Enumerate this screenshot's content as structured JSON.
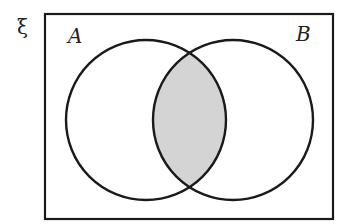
{
  "diagram": {
    "type": "venn",
    "universal_label": "ξ",
    "sets": [
      {
        "name": "A",
        "label": "A"
      },
      {
        "name": "B",
        "label": "B"
      }
    ],
    "shaded_region": "A ∩ B",
    "colors": {
      "stroke": "#1a1a1a",
      "shade": "#d4d4d4",
      "background": "#ffffff"
    }
  }
}
